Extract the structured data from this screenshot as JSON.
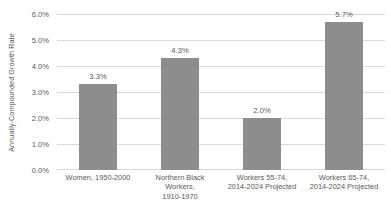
{
  "chart_data": {
    "type": "bar",
    "title": "",
    "xlabel": "",
    "ylabel": "Annually-Compounded Growth Rate",
    "ylim": [
      0,
      6
    ],
    "ytick_labels": [
      "6.0%",
      "5.0%",
      "4.0%",
      "3.0%",
      "2.0%",
      "1.0%",
      "0.0%"
    ],
    "ytick_values": [
      6,
      5,
      4,
      3,
      2,
      1,
      0
    ],
    "grid": true,
    "legend": null,
    "bar_color": "#8d8d8d",
    "gridline_color": "#d9d9d9",
    "text_color": "#595959",
    "categories": [
      "Women, 1950-2000",
      "Northern Black Workers, 1910-1970",
      "Workers 55-74, 2014-2024 Projected",
      "Workers 65-74, 2014-2024 Projected"
    ],
    "category_lines": [
      [
        "Women, 1950-2000"
      ],
      [
        "Northern Black",
        "Workers,",
        "1910-1970"
      ],
      [
        "Workers 55-74,",
        "2014-2024 Projected"
      ],
      [
        "Workers 65-74,",
        "2014-2024 Projected"
      ]
    ],
    "values": [
      3.3,
      4.3,
      2.0,
      5.7
    ],
    "value_labels": [
      "3.3%",
      "4.3%",
      "2.0%",
      "5.7%"
    ]
  }
}
